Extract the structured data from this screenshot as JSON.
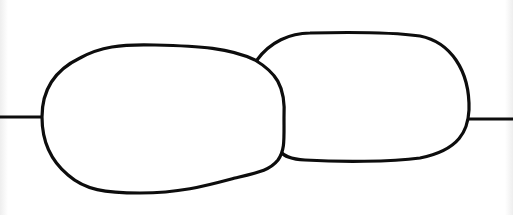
{
  "diagram": {
    "shapes": [
      {
        "name": "left-blob",
        "bbox": [
          42,
          44,
          285,
          194
        ]
      },
      {
        "name": "right-blob",
        "bbox": [
          255,
          32,
          470,
          162
        ]
      }
    ],
    "lines": [
      {
        "name": "left-line",
        "from": [
          0,
          117
        ],
        "to": [
          42,
          117
        ]
      },
      {
        "name": "right-line",
        "from": [
          468,
          119
        ],
        "to": [
          513,
          119
        ]
      }
    ],
    "colors": {
      "stroke": "#0d0d0d",
      "fill": "#ffffff",
      "background": "#ffffff"
    }
  }
}
